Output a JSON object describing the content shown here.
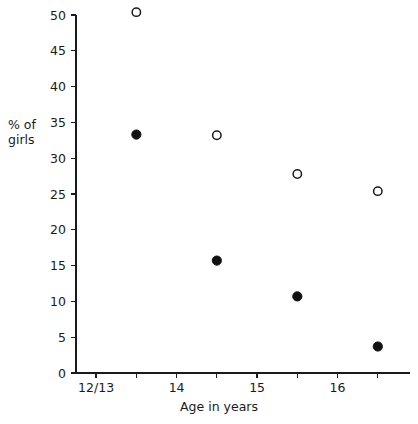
{
  "chart_data": {
    "type": "scatter",
    "title": "",
    "xlabel": "Age in years",
    "ylabel": "% of girls",
    "ylabel_lines": [
      "% of",
      "girls"
    ],
    "xlim": [
      12.75,
      16.9
    ],
    "ylim": [
      0,
      50
    ],
    "grid": false,
    "legend": "none",
    "y_ticks": [
      0,
      5,
      10,
      15,
      20,
      25,
      30,
      35,
      40,
      45,
      50
    ],
    "y_tick_labels": [
      "0",
      "5",
      "10",
      "15",
      "20",
      "25",
      "30",
      "35",
      "40",
      "45",
      "50"
    ],
    "x_ticks": [
      13,
      13.5,
      14,
      14.5,
      15,
      15.5,
      16,
      16.5
    ],
    "x_tick_labels": [
      "12/13",
      "",
      "14",
      "",
      "15",
      "",
      "16",
      ""
    ],
    "series": [
      {
        "name": "open-circles",
        "marker": "open-circle",
        "color": "#1a1a1a",
        "x": [
          13.5,
          14.5,
          15.5,
          16.5
        ],
        "y": [
          50.4,
          33.2,
          27.8,
          25.4
        ]
      },
      {
        "name": "filled-circles",
        "marker": "filled-circle",
        "color": "#111111",
        "x": [
          13.5,
          14.5,
          15.5,
          16.5
        ],
        "y": [
          33.3,
          15.7,
          10.7,
          3.7
        ]
      }
    ]
  },
  "colors": {
    "axis": "#1a1a1a",
    "marker_fill": "#111111",
    "background": "#ffffff"
  }
}
